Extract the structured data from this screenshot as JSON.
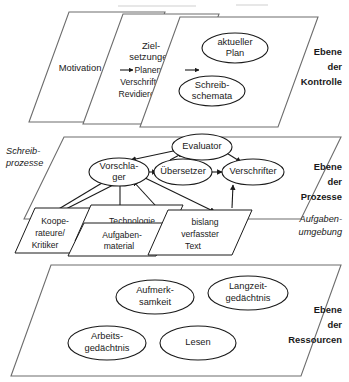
{
  "diagram": {
    "levels": [
      {
        "id": "kontrolle",
        "level_label_lines": [
          "Ebene",
          "der",
          "Kontrolle"
        ],
        "planes": [
          {
            "id": "motivation",
            "label": "Motivation"
          },
          {
            "id": "zielsetzungen",
            "label": "Ziel-",
            "label2": "setzungen",
            "sub_items": [
              "Planen",
              "Verschriften",
              "Revidieren"
            ]
          },
          {
            "id": "plan-schemata",
            "nodes": [
              {
                "id": "aktueller-plan",
                "line1": "aktueller",
                "line2": "Plan"
              },
              {
                "id": "schreibschemata",
                "line1": "Schreib-",
                "line2": "schemata"
              }
            ]
          }
        ]
      },
      {
        "id": "prozesse",
        "level_label_lines": [
          "Ebene",
          "der",
          "Prozesse"
        ],
        "side_label_lines": [
          "Schreib-",
          "prozesse"
        ],
        "env_label_lines": [
          "Aufgaben-",
          "umgebung"
        ],
        "process_nodes": [
          {
            "id": "evaluator",
            "label": "Evaluator"
          },
          {
            "id": "vorschlager",
            "line1": "Vorschla-",
            "line2": "ger"
          },
          {
            "id": "uebersetzer",
            "label": "Übersetzer"
          },
          {
            "id": "verschrifter",
            "label": "Verschrifter"
          }
        ],
        "env_planes": [
          {
            "id": "kooperateure",
            "lines": [
              "Koope-",
              "rateure/",
              "Kritiker"
            ]
          },
          {
            "id": "technologie",
            "lines": [
              "Technologie"
            ]
          },
          {
            "id": "aufgabenmaterial",
            "lines": [
              "Aufgaben-",
              "material"
            ]
          },
          {
            "id": "bislang-text",
            "lines": [
              "bislang",
              "verfasster",
              "Text"
            ]
          }
        ]
      },
      {
        "id": "ressourcen",
        "level_label_lines": [
          "Ebene",
          "der",
          "Ressourcen"
        ],
        "resource_nodes": [
          {
            "id": "aufmerksamkeit",
            "line1": "Aufmerk-",
            "line2": "samkeit"
          },
          {
            "id": "langzeitgedaechtnis",
            "line1": "Langzeit-",
            "line2": "gedächtnis"
          },
          {
            "id": "arbeitsgedaechtnis",
            "line1": "Arbeits-",
            "line2": "gedächtnis"
          },
          {
            "id": "lesen",
            "line1": "Lesen",
            "line2": ""
          }
        ]
      }
    ],
    "colors": {
      "ink": "#1a1a1a",
      "plane_stroke": "#6d6d6d",
      "background": "#ffffff"
    }
  }
}
